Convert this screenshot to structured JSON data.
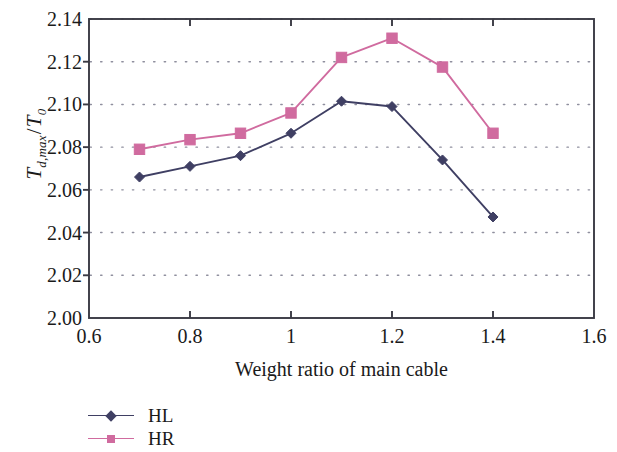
{
  "chart_data": {
    "type": "line",
    "title": "",
    "subtitle": "",
    "xlabel": "Weight ratio of main cable",
    "ylabel": "T_{d,max}/T_0",
    "ylabel_parts": {
      "main": "T",
      "subscript": "d,max",
      "slash": "/",
      "denominator": "T",
      "denominator_subscript": "0"
    },
    "x": [
      0.7,
      0.8,
      0.9,
      1.0,
      1.1,
      1.2,
      1.3,
      1.4
    ],
    "series": [
      {
        "name": "HL",
        "color": "#3f3f63",
        "marker": "diamond",
        "values": [
          2.066,
          2.071,
          2.076,
          2.0865,
          2.1015,
          2.099,
          2.074,
          2.0473
        ]
      },
      {
        "name": "HR",
        "color": "#d06b9f",
        "marker": "square",
        "values": [
          2.079,
          2.0835,
          2.0865,
          2.096,
          2.122,
          2.131,
          2.1175,
          2.0865
        ]
      }
    ],
    "xlim": [
      0.6,
      1.6
    ],
    "ylim": [
      2.0,
      2.14
    ],
    "xticks": [
      0.6,
      0.8,
      1.0,
      1.2,
      1.4,
      1.6
    ],
    "xtick_labels": [
      "0.6",
      "0.8",
      "1",
      "1.2",
      "1.4",
      "1.6"
    ],
    "yticks": [
      2.0,
      2.02,
      2.04,
      2.06,
      2.08,
      2.1,
      2.12,
      2.14
    ],
    "ytick_labels": [
      "2.00",
      "2.02",
      "2.04",
      "2.06",
      "2.08",
      "2.10",
      "2.12",
      "2.14"
    ],
    "grid": "horizontal-dotted",
    "legend_position": "below-left",
    "axis_color": "#3a3a44",
    "grid_color": "#8f8f9e",
    "background": "#ffffff"
  },
  "legend": {
    "items": [
      {
        "label": "HL"
      },
      {
        "label": "HR"
      }
    ]
  }
}
